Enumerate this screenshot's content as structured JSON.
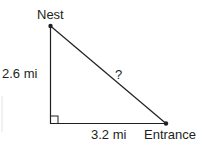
{
  "diagram": {
    "type": "right-triangle",
    "labels": {
      "top_vertex": "Nest",
      "right_vertex": "Entrance",
      "vertical_side": "2.6 mi",
      "horizontal_side": "3.2 mi",
      "hypotenuse": "?"
    },
    "colors": {
      "line": "#231f20",
      "background": "#ffffff"
    }
  }
}
